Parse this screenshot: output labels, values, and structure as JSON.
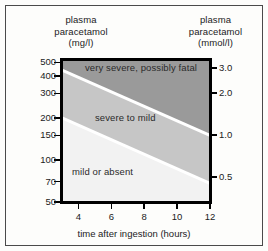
{
  "figure": {
    "background_color": "#fdfdfb",
    "border_color": "#4a4a4a"
  },
  "left_axis_title": {
    "line1": "plasma",
    "line2": "paracetamol",
    "line3": "(mg/l)"
  },
  "right_axis_title": {
    "line1": "plasma",
    "line2": "paracetamol",
    "line3": "(mmol/l)"
  },
  "x_caption": "time after ingestion (hours)",
  "bands": {
    "top_label": "very severe, possibly fatal",
    "middle_label": "severe to mild",
    "bottom_label": "mild or absent",
    "top_color": "#9a9a9a",
    "middle_color": "#c6c6c6",
    "bottom_color": "#f2f2f2",
    "divider_color": "#ffffff"
  },
  "chart_data": {
    "type": "area",
    "xlabel": "time after ingestion (hours)",
    "ylabel": "plasma paracetamol (mg/l)",
    "y2label": "plasma paracetamol (mmol/l)",
    "xlim": [
      3,
      12
    ],
    "ylim": [
      50,
      520
    ],
    "yscale": "log",
    "grid": false,
    "legend": "none",
    "xticks": [
      4,
      6,
      8,
      10,
      12
    ],
    "xticklabels": [
      "4",
      "6",
      "8",
      "10",
      "12"
    ],
    "yticks": [
      50,
      70,
      100,
      150,
      200,
      300,
      400,
      500
    ],
    "yticklabels": [
      "50",
      "70",
      "100",
      "150",
      "200",
      "300",
      "400",
      "500"
    ],
    "y2ticks": [
      0.5,
      1.0,
      2.0,
      3.0
    ],
    "y2ticklabels": [
      "0.5",
      "1.0",
      "2.0",
      "3.0"
    ],
    "series": [
      {
        "name": "upper treatment line (very severe / severe boundary)",
        "points": [
          {
            "x": 3,
            "y": 440
          },
          {
            "x": 12,
            "y": 150
          }
        ]
      },
      {
        "name": "lower treatment line (severe / mild boundary)",
        "points": [
          {
            "x": 3,
            "y": 200
          },
          {
            "x": 12,
            "y": 68
          }
        ]
      }
    ],
    "regions": [
      {
        "name": "very severe, possibly fatal",
        "above": "upper treatment line",
        "color": "#9a9a9a"
      },
      {
        "name": "severe to mild",
        "between": [
          "upper treatment line",
          "lower treatment line"
        ],
        "color": "#c6c6c6"
      },
      {
        "name": "mild or absent",
        "below": "lower treatment line",
        "color": "#f2f2f2"
      }
    ]
  }
}
